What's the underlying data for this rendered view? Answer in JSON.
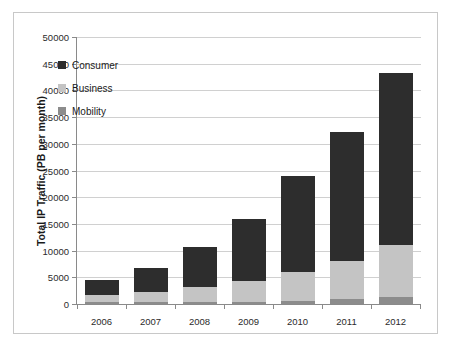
{
  "chart_data": {
    "type": "bar",
    "subtype": "stacked-bar",
    "title": "",
    "xlabel": "",
    "ylabel": "Total IP Traffic (PB per month)",
    "categories": [
      "2006",
      "2007",
      "2008",
      "2009",
      "2010",
      "2011",
      "2012"
    ],
    "series": [
      {
        "name": "Mobility",
        "color": "#8c8c8c",
        "values": [
          180,
          240,
          330,
          450,
          620,
          900,
          1250
        ]
      },
      {
        "name": "Business",
        "color": "#c4c4c4",
        "values": [
          1320,
          1810,
          2720,
          3850,
          5380,
          7100,
          9750
        ]
      },
      {
        "name": "Consumer",
        "color": "#2d2d2d",
        "values": [
          2800,
          4550,
          7650,
          11700,
          17900,
          24200,
          32300
        ]
      }
    ],
    "stack_order": [
      "Mobility",
      "Business",
      "Consumer"
    ],
    "totals": [
      4300,
      6600,
      10700,
      16000,
      23900,
      32200,
      43300
    ],
    "ylim": [
      0,
      50000
    ],
    "yticks": [
      0,
      5000,
      10000,
      15000,
      20000,
      25000,
      30000,
      35000,
      40000,
      45000,
      50000
    ],
    "ytick_labels": [
      "0",
      "5000",
      "10000",
      "15000",
      "20000",
      "25000",
      "30000",
      "35000",
      "40000",
      "45000",
      "50000"
    ],
    "grid": "horizontal",
    "legend_position": "inside-upper-left",
    "legend": [
      "Consumer",
      "Business",
      "Mobility"
    ]
  },
  "colors": {
    "consumer": "#2d2d2d",
    "business": "#c4c4c4",
    "mobility": "#8c8c8c",
    "gridline": "#d0d0d0",
    "axis": "#8a8a8a",
    "frame_border": "#c8c8c8",
    "background": "#ffffff",
    "text": "#1a1a1a"
  }
}
